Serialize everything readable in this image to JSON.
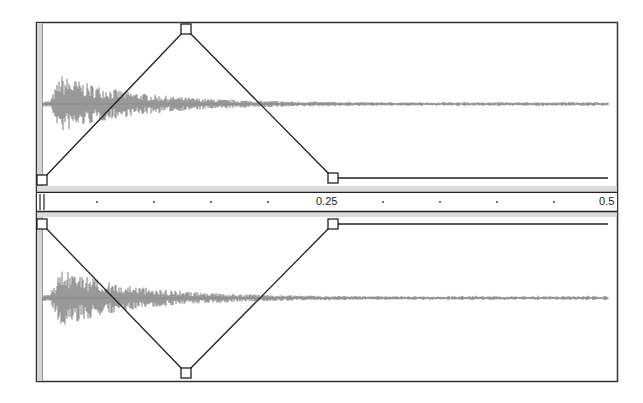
{
  "editor": {
    "type": "stereo-envelope-editor",
    "colors": {
      "frame": "#333333",
      "waveform": "#6e6e6e",
      "envelope": "#222222",
      "ruler_band": "#d8d8d8",
      "strip": "#d0d0d0"
    }
  },
  "ruler": {
    "labels": [
      {
        "text": "0.25",
        "x": 316
      },
      {
        "text": "0.5",
        "x": 599
      }
    ],
    "minor_ticks_x": [
      97,
      154,
      211,
      268,
      383,
      440,
      497,
      554
    ]
  },
  "channels": [
    {
      "name": "top-channel",
      "center_y": 104,
      "envelope_nodes": [
        {
          "x": 42,
          "y": 180
        },
        {
          "x": 186,
          "y": 29
        },
        {
          "x": 333,
          "y": 178
        }
      ],
      "envelope_end_x": 608
    },
    {
      "name": "bottom-channel",
      "center_y": 298,
      "envelope_nodes": [
        {
          "x": 42,
          "y": 224
        },
        {
          "x": 186,
          "y": 373
        },
        {
          "x": 333,
          "y": 224
        }
      ],
      "envelope_end_x": 608
    }
  ]
}
